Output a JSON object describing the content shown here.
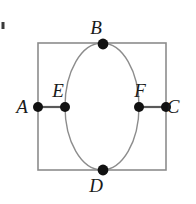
{
  "figure": {
    "type": "geometry-diagram",
    "canvas": {
      "width": 196,
      "height": 204,
      "background": "#ffffff"
    },
    "colors": {
      "background": "#ffffff",
      "rectangle_stroke": "#8c8c8c",
      "ellipse_stroke": "#8c8c8c",
      "segment_stroke": "#595959",
      "point_fill": "#111111",
      "label_fill": "#1a1a1a"
    },
    "rectangle": {
      "name": "bounding-rectangle",
      "x": 38,
      "y": 43,
      "width": 128,
      "height": 127,
      "stroke_width": 1.6
    },
    "ellipse": {
      "name": "inscribed-ellipse",
      "cx": 102,
      "cy": 106.5,
      "rx": 37,
      "ry": 63.5,
      "stroke_width": 1.4
    },
    "segments": [
      {
        "name": "segment-AE",
        "from": "A",
        "to": "E",
        "x1": 38,
        "y1": 107,
        "x2": 65,
        "y2": 107
      },
      {
        "name": "segment-FC",
        "from": "F",
        "to": "C",
        "x1": 139,
        "y1": 107,
        "x2": 166,
        "y2": 107
      }
    ],
    "points": [
      {
        "id": "A",
        "label": "A",
        "x": 38,
        "y": 107,
        "r": 5.0,
        "label_x": 22,
        "label_y": 113
      },
      {
        "id": "B",
        "label": "B",
        "x": 103,
        "y": 44,
        "r": 5.4,
        "label_x": 96,
        "label_y": 34
      },
      {
        "id": "C",
        "label": "C",
        "x": 166,
        "y": 107,
        "r": 5.0,
        "label_x": 173,
        "label_y": 113
      },
      {
        "id": "D",
        "label": "D",
        "x": 103,
        "y": 170,
        "r": 5.4,
        "label_x": 96,
        "label_y": 192
      },
      {
        "id": "E",
        "label": "E",
        "x": 65,
        "y": 107,
        "r": 5.0,
        "label_x": 58,
        "label_y": 97
      },
      {
        "id": "F",
        "label": "F",
        "x": 139,
        "y": 107,
        "r": 5.0,
        "label_x": 140,
        "label_y": 97
      }
    ],
    "stray_mark": {
      "name": "stray-speck",
      "x": 1.5,
      "y": 22,
      "width": 3,
      "height": 7
    }
  }
}
